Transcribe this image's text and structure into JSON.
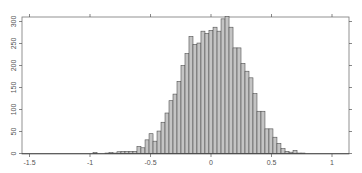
{
  "chart_data": {
    "type": "bar",
    "title": "",
    "xlabel": "",
    "ylabel": "",
    "xlim": [
      -1.55,
      1.14
    ],
    "ylim": [
      0,
      320
    ],
    "xticks": [
      -1.5,
      -1,
      -0.5,
      0,
      0.5,
      1
    ],
    "xtick_labels": [
      "-1.5",
      "-1",
      "-0.5",
      "0",
      "0.5",
      "1"
    ],
    "yticks": [
      0,
      50,
      100,
      150,
      200,
      250,
      300
    ],
    "ytick_labels": [
      "0",
      "50",
      "100",
      "150",
      "200",
      "250",
      "300"
    ],
    "grid": false,
    "legend": null,
    "bin_width": 0.033,
    "bin_left_edges": [
      -0.975,
      -0.876,
      -0.843,
      -0.81,
      -0.777,
      -0.744,
      -0.711,
      -0.678,
      -0.645,
      -0.612,
      -0.579,
      -0.545,
      -0.512,
      -0.479,
      -0.446,
      -0.413,
      -0.38,
      -0.347,
      -0.314,
      -0.281,
      -0.248,
      -0.215,
      -0.182,
      -0.149,
      -0.116,
      -0.083,
      -0.05,
      -0.017,
      0.017,
      0.05,
      0.083,
      0.116,
      0.149,
      0.182,
      0.215,
      0.248,
      0.281,
      0.314,
      0.347,
      0.38,
      0.413,
      0.446,
      0.479,
      0.512,
      0.545,
      0.579,
      0.612,
      0.645,
      0.678,
      0.711,
      0.744
    ],
    "values": [
      2,
      1,
      2,
      1,
      4,
      5,
      5,
      5,
      5,
      16,
      13,
      31,
      45,
      28,
      51,
      71,
      92,
      120,
      135,
      164,
      200,
      227,
      266,
      248,
      251,
      278,
      273,
      280,
      287,
      278,
      306,
      311,
      287,
      240,
      240,
      205,
      187,
      172,
      136,
      96,
      96,
      56,
      56,
      37,
      23,
      11,
      5,
      3,
      7,
      1,
      1
    ],
    "bar_fill": "#c4c4c4",
    "bar_edge": "#505050"
  }
}
